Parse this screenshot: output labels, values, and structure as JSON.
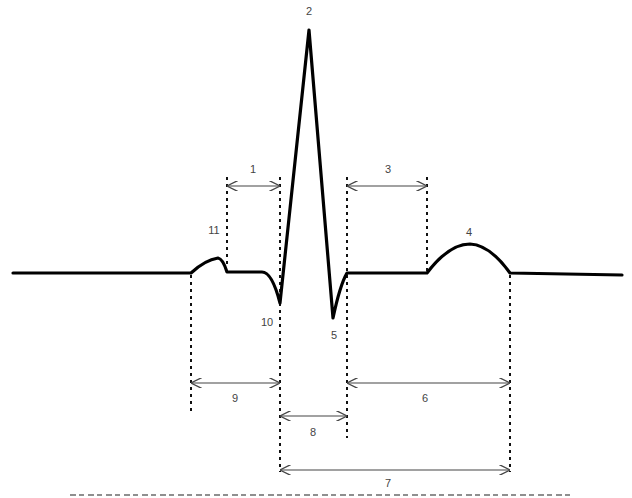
{
  "diagram": {
    "type": "ECG waveform with labeled intervals",
    "labels": [
      {
        "id": "1",
        "text": "1",
        "x": 253,
        "y": 172
      },
      {
        "id": "2",
        "text": "2",
        "x": 309,
        "y": 14
      },
      {
        "id": "3",
        "text": "3",
        "x": 388,
        "y": 172
      },
      {
        "id": "4",
        "text": "4",
        "x": 469,
        "y": 235
      },
      {
        "id": "5",
        "text": "5",
        "x": 334,
        "y": 338
      },
      {
        "id": "6",
        "text": "6",
        "x": 425,
        "y": 401
      },
      {
        "id": "7",
        "text": "7",
        "x": 388,
        "y": 486
      },
      {
        "id": "8",
        "text": "8",
        "x": 313,
        "y": 435
      },
      {
        "id": "9",
        "text": "9",
        "x": 235,
        "y": 401
      },
      {
        "id": "10",
        "text": "10",
        "x": 267,
        "y": 325
      },
      {
        "id": "11",
        "text": "11",
        "x": 214,
        "y": 233
      }
    ],
    "colors": {
      "waveform": "#000000",
      "guides": "#111111",
      "arrows": "#444444",
      "labels": "#444444"
    }
  },
  "caption": {
    "visible": true,
    "clipped": true
  }
}
